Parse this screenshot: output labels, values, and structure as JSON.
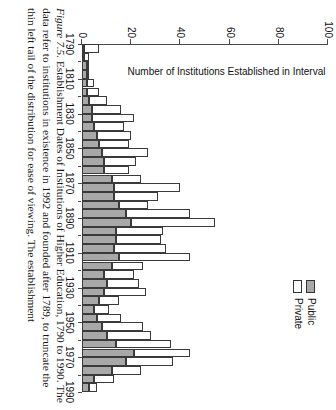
{
  "figure": {
    "number_label": "Figure 7.5.",
    "title": "Establishment Dates of Institutions of Higher Education, 1790 to 1990.",
    "caption_line2": "The data refer to institutions in existence in 1992 and founded after 1789, to",
    "caption_line3": "truncate the thin left tail of the distribution for ease of viewing. The establishment"
  },
  "legend": {
    "position": "top-right",
    "items": [
      {
        "label": "Public",
        "color": "#a8a8a8"
      },
      {
        "label": "Private",
        "color": "#ffffff"
      }
    ]
  },
  "axes": {
    "value_axis_title": "Number of Institutions Established in Interval",
    "value_ticks": [
      "0",
      "20",
      "40",
      "60",
      "80",
      "100"
    ],
    "category_ticks": [
      "1790",
      "1810",
      "1830",
      "1850",
      "1870",
      "1890",
      "1910",
      "1930",
      "1950",
      "1970",
      "1990"
    ]
  },
  "colors": {
    "public": "#a8a8a8",
    "private": "#ffffff",
    "outline": "#3a3a3a",
    "axis": "#4a4a4a",
    "text": "#111111"
  },
  "chart_data": {
    "type": "bar",
    "orientation": "vertical-stacked",
    "title": "Establishment Dates of Institutions of Higher Education, 1790 to 1990",
    "xlabel": "",
    "ylabel": "Number of Institutions Established in Interval",
    "ylim": [
      0,
      100
    ],
    "ytick_values": [
      0,
      20,
      40,
      60,
      80,
      100
    ],
    "grid": false,
    "legend_position": "top-right",
    "bin_width_years": 5,
    "categories": [
      "1790",
      "1795",
      "1800",
      "1805",
      "1810",
      "1815",
      "1820",
      "1825",
      "1830",
      "1835",
      "1840",
      "1845",
      "1850",
      "1855",
      "1860",
      "1865",
      "1870",
      "1875",
      "1880",
      "1885",
      "1890",
      "1895",
      "1900",
      "1905",
      "1910",
      "1915",
      "1920",
      "1925",
      "1930",
      "1935",
      "1940",
      "1945",
      "1950",
      "1955",
      "1960",
      "1965",
      "1970",
      "1975",
      "1980",
      "1985"
    ],
    "series": [
      {
        "name": "Public",
        "color": "#a8a8a8",
        "values": [
          1,
          1,
          2,
          2,
          2,
          2,
          3,
          4,
          4,
          5,
          6,
          7,
          8,
          9,
          9,
          12,
          13,
          13,
          15,
          18,
          20,
          14,
          14,
          13,
          15,
          12,
          9,
          10,
          9,
          7,
          5,
          6,
          8,
          10,
          14,
          21,
          18,
          12,
          5,
          3
        ]
      },
      {
        "name": "Private",
        "color": "#ffffff",
        "values": [
          6,
          2,
          1,
          1,
          3,
          5,
          7,
          12,
          17,
          12,
          14,
          12,
          19,
          13,
          10,
          12,
          27,
          18,
          12,
          26,
          34,
          19,
          18,
          21,
          29,
          13,
          12,
          13,
          17,
          8,
          6,
          10,
          17,
          18,
          22,
          23,
          19,
          12,
          8,
          3
        ]
      }
    ]
  }
}
